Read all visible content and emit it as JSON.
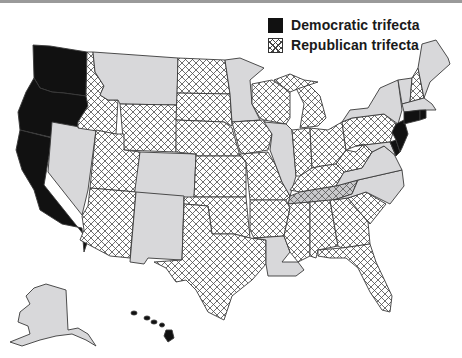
{
  "legend": {
    "democratic_label": "Democratic trifecta",
    "republican_label": "Republican trifecta"
  },
  "colors": {
    "democratic": "#111111",
    "divided": "#d8d8da",
    "republican_hatch": "#444444",
    "border": "#3a3a3a"
  },
  "states": {
    "WA": "democratic",
    "OR": "democratic",
    "CA": "democratic",
    "HI": "democratic",
    "NJ": "democratic",
    "CT": "democratic",
    "RI": "democratic",
    "DE": "democratic",
    "NV": "divided",
    "MT": "divided",
    "CO": "divided",
    "NM": "divided",
    "MN": "divided",
    "IL": "divided",
    "LA": "divided",
    "NC": "divided",
    "VA": "divided",
    "NY": "divided",
    "MA": "divided",
    "VT": "divided",
    "ME": "divided",
    "MD": "divided",
    "AK": "divided",
    "ID": "republican",
    "UT": "republican",
    "AZ": "republican",
    "WY": "republican",
    "ND": "republican",
    "SD": "republican",
    "NE": "republican",
    "KS": "republican",
    "OK": "republican",
    "TX": "republican",
    "IA": "republican",
    "MO": "republican",
    "AR": "republican",
    "WI": "republican",
    "MI": "republican",
    "IN": "republican",
    "OH": "republican",
    "KY": "republican",
    "MS": "republican",
    "AL": "republican",
    "GA": "republican",
    "SC": "republican",
    "FL": "republican",
    "PA": "republican",
    "WV": "republican",
    "NH": "republican",
    "TN": "republican-shaded"
  }
}
